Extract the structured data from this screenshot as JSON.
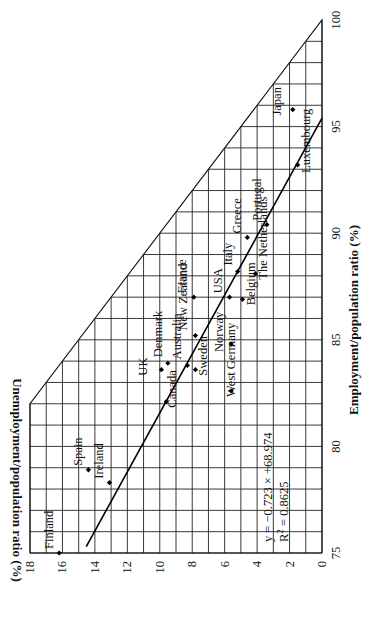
{
  "chart_data": {
    "type": "scatter",
    "orientation": "rotated-90-ccw",
    "title": "",
    "xlabel": "Employment/population ratio (%)",
    "ylabel": "Unemployment/population ratio (%)",
    "xlim": [
      75,
      100
    ],
    "ylim": [
      0,
      18
    ],
    "x_ticks": [
      75,
      80,
      85,
      90,
      95,
      100
    ],
    "y_ticks": [
      0,
      2,
      4,
      6,
      8,
      10,
      12,
      14,
      16,
      18
    ],
    "grid": true,
    "grid_step_x": 1,
    "grid_step_y": 1,
    "boundary": {
      "description": "x + y = 100",
      "from": [
        82,
        18
      ],
      "to": [
        100,
        0
      ]
    },
    "points": [
      {
        "label": "Finland",
        "x": 75.0,
        "y": 16.2
      },
      {
        "label": "Spain",
        "x": 78.9,
        "y": 14.4
      },
      {
        "label": "Ireland",
        "x": 78.3,
        "y": 13.1
      },
      {
        "label": "Canada",
        "x": 82.1,
        "y": 9.6
      },
      {
        "label": "UK",
        "x": 83.6,
        "y": 9.9
      },
      {
        "label": "Denmark",
        "x": 83.9,
        "y": 9.5
      },
      {
        "label": "Australia",
        "x": 83.8,
        "y": 8.3
      },
      {
        "label": "Sweden",
        "x": 83.6,
        "y": 7.8
      },
      {
        "label": "New Zealand",
        "x": 85.2,
        "y": 7.8
      },
      {
        "label": "Norway",
        "x": 84.8,
        "y": 5.6
      },
      {
        "label": "West Germany",
        "x": 82.6,
        "y": 5.6
      },
      {
        "label": "France",
        "x": 87.0,
        "y": 7.9
      },
      {
        "label": "USA",
        "x": 87.0,
        "y": 5.7
      },
      {
        "label": "Belgium",
        "x": 86.9,
        "y": 4.9
      },
      {
        "label": "Italy",
        "x": 88.2,
        "y": 5.2
      },
      {
        "label": "The Netherlands",
        "x": 88.1,
        "y": 4.1
      },
      {
        "label": "Greece",
        "x": 89.8,
        "y": 4.6
      },
      {
        "label": "Portugal",
        "x": 90.4,
        "y": 3.4
      },
      {
        "label": "Luxembourg",
        "x": 93.2,
        "y": 1.5
      },
      {
        "label": "Japan",
        "x": 95.8,
        "y": 1.8
      }
    ],
    "trendline": {
      "slope": -0.723,
      "intercept": 68.974,
      "equation": "y = −0.723 × +68.974",
      "r_squared_label": "R",
      "r_squared_sup": "2",
      "r_squared_value": " = 0.8625",
      "x_range": [
        75.3,
        95.4
      ]
    },
    "legend": null
  }
}
